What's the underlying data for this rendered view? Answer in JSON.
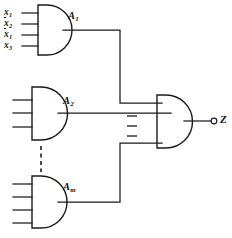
{
  "figure": {
    "ink_color": "#1b1b1b",
    "background": "#ffffff"
  },
  "inputs": [
    {
      "id": "in-1",
      "base": "x",
      "subscript": "1",
      "complemented": false,
      "label": "x1"
    },
    {
      "id": "in-2",
      "base": "x",
      "subscript": "2",
      "complemented": true,
      "label": "x2-bar"
    },
    {
      "id": "in-3",
      "base": "x",
      "subscript": "1",
      "complemented": true,
      "label": "x1-bar"
    },
    {
      "id": "in-4",
      "base": "x",
      "subscript": "3",
      "complemented": false,
      "label": "x3"
    }
  ],
  "gates": [
    {
      "id": "gate-a1",
      "base": "A",
      "subscript": "1",
      "type": "and",
      "input_count": 4,
      "inputs_labeled": true
    },
    {
      "id": "gate-a2",
      "base": "A",
      "subscript": "2",
      "type": "and",
      "input_count": 3,
      "inputs_labeled": false
    },
    {
      "id": "gate-am",
      "base": "A",
      "subscript": "m",
      "type": "and",
      "input_count": 4,
      "inputs_labeled": false
    }
  ],
  "output_gate": {
    "id": "gate-output",
    "type": "and",
    "input_count": 3
  },
  "output": {
    "base": "Z",
    "subscript": "",
    "label": "Z",
    "terminal": "open-circle"
  },
  "continuation": {
    "vertical_dashed_between_gates": true,
    "ellipsis_dashes": 3
  }
}
